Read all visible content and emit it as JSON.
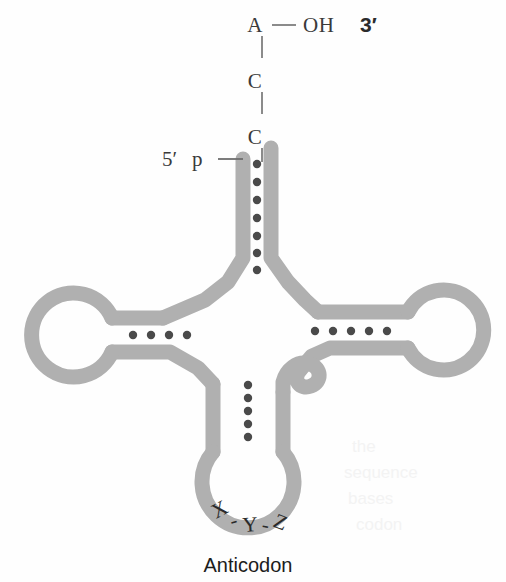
{
  "figure": {
    "background_color": "#fefefe",
    "ribbon_color": "#b0b0b0",
    "basepair_dot_color": "#4a4a4a",
    "text_color": "#3a3a3a"
  },
  "acceptor_end": {
    "terminal_a": "A",
    "dash": "—",
    "hydroxyl": "OH",
    "three_prime": "3′",
    "c_upper": "C",
    "c_lower": "C",
    "bond_1": "|",
    "bond_2": "|",
    "bond_3": "|"
  },
  "five_prime_end": {
    "label": "5′",
    "phosphate": "p"
  },
  "anticodon": {
    "caption": "Anticodon",
    "bases": [
      "X",
      "-",
      "Y",
      "-",
      "Z"
    ],
    "base_string": "X-Y-Z"
  },
  "stems": {
    "acceptor_stem": {
      "name": "acceptor-stem",
      "base_pairs": 7
    },
    "d_stem": {
      "name": "d-arm-stem",
      "base_pairs": 4
    },
    "t_stem": {
      "name": "t-arm-stem",
      "base_pairs": 5
    },
    "anticodon_stem": {
      "name": "anticodon-stem",
      "base_pairs": 5
    }
  },
  "loops": {
    "d_loop": {
      "name": "d-loop"
    },
    "t_loop": {
      "name": "t-loop"
    },
    "variable_loop": {
      "name": "variable-loop"
    },
    "anticodon_loop": {
      "name": "anticodon-loop"
    }
  },
  "ghost_text": {
    "line_1": "the",
    "line_2": "sequence",
    "line_3": "bases",
    "line_4": "codon"
  }
}
